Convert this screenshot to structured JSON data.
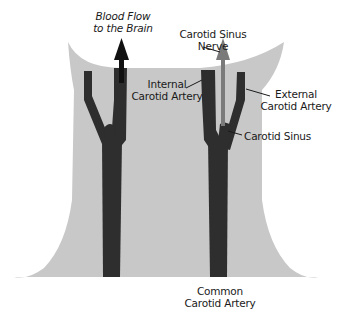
{
  "diagram": {
    "colors": {
      "background": "#ffffff",
      "neck": "#c8c8c8",
      "artery": "#2e2e2e",
      "blood_arrow": "#111111",
      "nerve_arrow": "#7a7a7a",
      "text": "#1a1a1a"
    },
    "labels": {
      "blood_flow_line1": "Blood Flow",
      "blood_flow_line2": "to the Brain",
      "nerve_line1": "Carotid Sinus",
      "nerve_line2": "Nerve",
      "internal_line1": "Internal",
      "internal_line2": "Carotid Artery",
      "external_line1": "External",
      "external_line2": "Carotid Artery",
      "sinus": "Carotid Sinus",
      "common_line1": "Common",
      "common_line2": "Carotid Artery"
    }
  }
}
